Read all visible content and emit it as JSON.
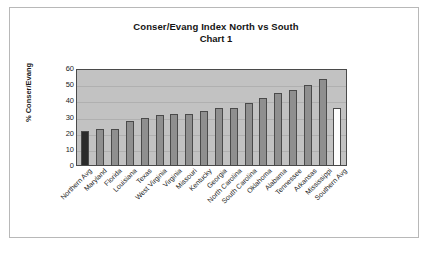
{
  "chart_data": {
    "type": "bar",
    "title": "Conser/Evang Index North vs South",
    "subtitle": "Chart 1",
    "xlabel": "",
    "ylabel": "% Conser/Evang",
    "ylim": [
      0,
      60
    ],
    "yticks": [
      60,
      50,
      40,
      30,
      20,
      10,
      0
    ],
    "grid": true,
    "legend": "none",
    "categories": [
      "Northern Avg",
      "Maryland",
      "Florida",
      "Louisiana",
      "Texas",
      "West Virginia",
      "Virginia",
      "Missouri",
      "Kentucky",
      "Georgia",
      "North Carolina",
      "South Carolina",
      "Oklahoma",
      "Alabama",
      "Tennessee",
      "Arkansas",
      "Mississippi",
      "Southern Avg"
    ],
    "values": [
      21,
      22,
      22,
      27,
      29,
      31,
      31.5,
      31.5,
      33.5,
      35,
      35.5,
      38.5,
      41.5,
      44.5,
      46.5,
      49.5,
      53,
      35
    ],
    "bar_styles": [
      "dark",
      "normal",
      "normal",
      "normal",
      "normal",
      "normal",
      "normal",
      "normal",
      "normal",
      "normal",
      "normal",
      "normal",
      "normal",
      "normal",
      "normal",
      "normal",
      "normal",
      "light"
    ],
    "colors": {
      "bar_normal": "#8f8f8f",
      "bar_dark": "#2b2b2b",
      "bar_light": "#fdfdfd",
      "plot_background": "#c2c2c2",
      "axis": "#4a4a4a",
      "gridline": "#b0b0b0",
      "text": "#1c1c1c",
      "figure_background": "#ffffff"
    }
  }
}
